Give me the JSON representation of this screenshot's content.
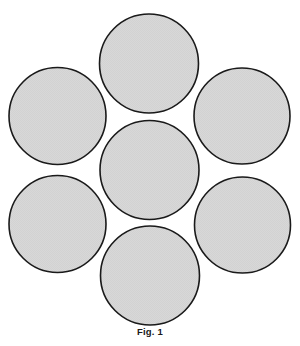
{
  "figure": {
    "caption": "Fig. 1",
    "background_color": "#ffffff",
    "fill_color": "#d6d6d6",
    "stroke_color": "#1a1a1a",
    "stroke_width": 1.6,
    "canvas": {
      "width": 300,
      "height": 346
    },
    "element_count": 7
  },
  "chart_data": {
    "type": "scatter",
    "title": "Fig. 1",
    "xlabel": "",
    "ylabel": "",
    "xlim": [
      0,
      300
    ],
    "ylim": [
      0,
      330
    ],
    "grid": false,
    "legend": "none",
    "radius": 49.5,
    "elements": [
      {
        "name": "circle-center",
        "position": "center",
        "cx": 149.5,
        "cy": 170.0,
        "r": 49.5
      },
      {
        "name": "circle-top",
        "position": "top",
        "cx": 149.0,
        "cy": 63.5,
        "r": 49.5
      },
      {
        "name": "circle-upper-left",
        "position": "upper-left",
        "cx": 57.5,
        "cy": 116.0,
        "r": 48.5
      },
      {
        "name": "circle-upper-right",
        "position": "upper-right",
        "cx": 242.0,
        "cy": 116.0,
        "r": 48.0
      },
      {
        "name": "circle-lower-left",
        "position": "lower-left",
        "cx": 57.5,
        "cy": 224.0,
        "r": 48.5
      },
      {
        "name": "circle-lower-right",
        "position": "lower-right",
        "cx": 242.5,
        "cy": 225.0,
        "r": 48.0
      },
      {
        "name": "circle-bottom",
        "position": "bottom",
        "cx": 150.0,
        "cy": 275.5,
        "r": 49.5
      }
    ]
  }
}
